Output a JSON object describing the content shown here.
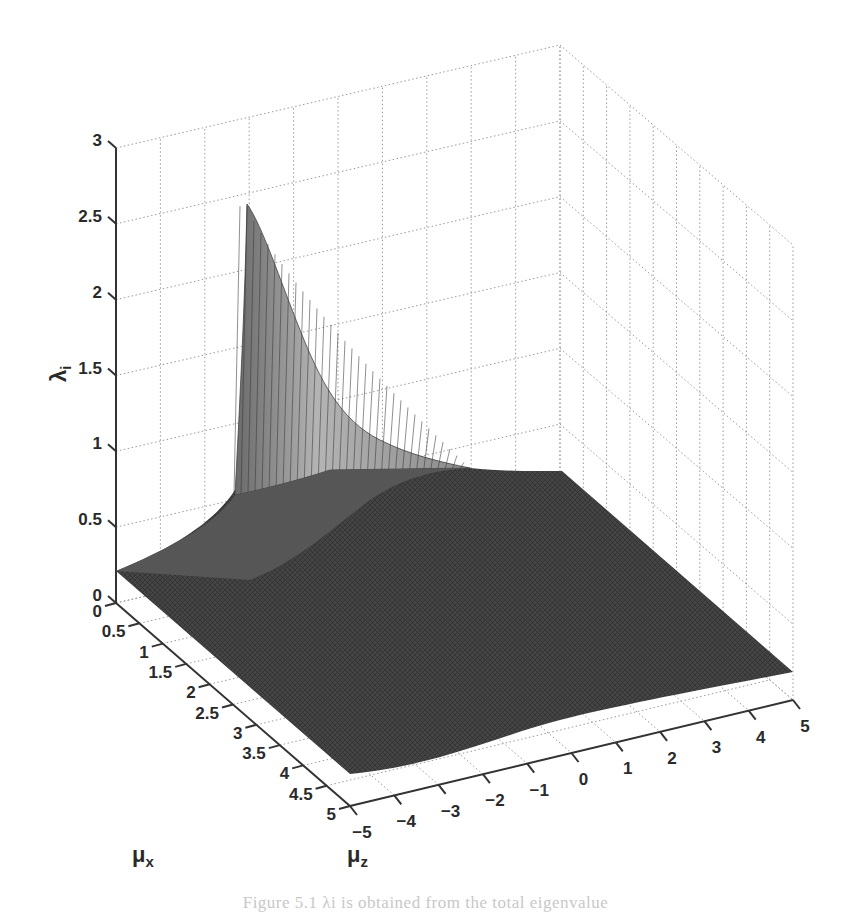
{
  "chart_data": {
    "type": "surface3d",
    "title": "",
    "xlabel": "μx",
    "ylabel": "μz",
    "zlabel": "λi",
    "x_axis": {
      "label_base": "μ",
      "label_sub": "x",
      "range": [
        0,
        5
      ],
      "ticks": [
        "0",
        "0.5",
        "1",
        "1.5",
        "2",
        "2.5",
        "3",
        "3.5",
        "4",
        "4.5",
        "5"
      ]
    },
    "y_axis": {
      "label_base": "μ",
      "label_sub": "z",
      "range": [
        -5,
        5
      ],
      "ticks": [
        "−5",
        "−4",
        "−3",
        "−2",
        "−1",
        "0",
        "1",
        "2",
        "3",
        "4",
        "5"
      ]
    },
    "z_axis": {
      "label_base": "λ",
      "label_sub": "i",
      "range": [
        0,
        3
      ],
      "ticks": [
        "0",
        "0.5",
        "1",
        "1.5",
        "2",
        "2.5",
        "3"
      ]
    },
    "grid": true,
    "colormap": "gray",
    "samples": {
      "mu_x": [
        0,
        0.5,
        1,
        2,
        3,
        4,
        5
      ],
      "mu_z": [
        -5,
        -3,
        -2,
        -1,
        0,
        1,
        3,
        5
      ],
      "lambda_i": [
        [
          0.21,
          0.45,
          2.5,
          1.2,
          0.55,
          0.35,
          0.25,
          0.19
        ],
        [
          0.2,
          0.35,
          0.9,
          0.85,
          0.5,
          0.33,
          0.24,
          0.18
        ],
        [
          0.19,
          0.28,
          0.5,
          0.6,
          0.45,
          0.3,
          0.22,
          0.17
        ],
        [
          0.17,
          0.22,
          0.3,
          0.35,
          0.32,
          0.25,
          0.19,
          0.15
        ],
        [
          0.15,
          0.18,
          0.22,
          0.25,
          0.24,
          0.21,
          0.17,
          0.14
        ],
        [
          0.14,
          0.16,
          0.18,
          0.2,
          0.2,
          0.18,
          0.15,
          0.13
        ],
        [
          0.13,
          0.14,
          0.15,
          0.17,
          0.17,
          0.16,
          0.14,
          0.12
        ]
      ]
    }
  },
  "caption": "Figure 5.1  λi is obtained from the total eigenvalue"
}
